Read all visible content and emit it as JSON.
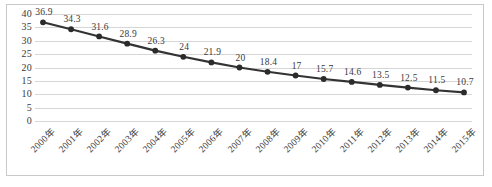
{
  "chart_data": {
    "type": "line",
    "title": "",
    "subtitle": "",
    "xlabel": "",
    "ylabel": "",
    "categories": [
      "2000年",
      "2001年",
      "2002年",
      "2003年",
      "2004年",
      "2005年",
      "2006年",
      "2007年",
      "2008年",
      "2009年",
      "2010年",
      "2011年",
      "2012年",
      "2013年",
      "2014年",
      "2015年"
    ],
    "values": [
      36.9,
      34.3,
      31.6,
      28.9,
      26.3,
      24,
      21.9,
      20,
      18.4,
      17,
      15.7,
      14.6,
      13.5,
      12.5,
      11.5,
      10.7
    ],
    "data_labels": [
      "36.9",
      "34.3",
      "31.6",
      "28.9",
      "26.3",
      "24",
      "21.9",
      "20",
      "18.4",
      "17",
      "15.7",
      "14.6",
      "13.5",
      "12.5",
      "11.5",
      "10.7"
    ],
    "ylim": [
      0,
      40
    ],
    "yticks": [
      40,
      35,
      30,
      25,
      20,
      15,
      10,
      5,
      0
    ],
    "ytick_labels": [
      "40",
      "35",
      "30",
      "25",
      "20",
      "15",
      "10",
      "5",
      "0"
    ],
    "grid": true,
    "grid_axis": "y",
    "legend": false,
    "legend_position": "none",
    "series": [
      {
        "name": "",
        "values": [
          36.9,
          34.3,
          31.6,
          28.9,
          26.3,
          24,
          21.9,
          20,
          18.4,
          17,
          15.7,
          14.6,
          13.5,
          12.5,
          11.5,
          10.7
        ]
      }
    ]
  },
  "style": {
    "line_color": "#333333",
    "marker_color": "#2b2b2b",
    "grid_color": "#d6d6d6",
    "border_color": "#c9c9c9",
    "background_color": "#ffffff",
    "text_color": "#3a3a3a"
  }
}
